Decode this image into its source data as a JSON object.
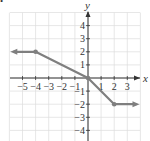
{
  "marker": "•",
  "chart_data": {
    "type": "line",
    "title": "",
    "xlabel": "x",
    "ylabel": "y",
    "xlim": [
      -5.9,
      4
    ],
    "ylim": [
      -4.9,
      5
    ],
    "grid": true,
    "x_ticks": [
      -5,
      -4,
      -3,
      -2,
      -1,
      1,
      2,
      3
    ],
    "y_ticks": [
      4,
      3,
      2,
      1,
      -1,
      -2,
      -3,
      -4
    ],
    "series": [
      {
        "name": "piecewise function",
        "color": "#7f7f7f",
        "points": [
          [
            -5.7,
            2
          ],
          [
            -4,
            2
          ],
          [
            0,
            0
          ],
          [
            2,
            -2
          ],
          [
            3.7,
            -2
          ]
        ],
        "closed_points": [
          [
            -4,
            2
          ],
          [
            0,
            0
          ],
          [
            2,
            -2
          ]
        ],
        "arrow_left": true,
        "arrow_right": true
      }
    ]
  },
  "colors": {
    "grid": "#dcdcdc",
    "axis": "#333333",
    "line": "#7f7f7f"
  }
}
